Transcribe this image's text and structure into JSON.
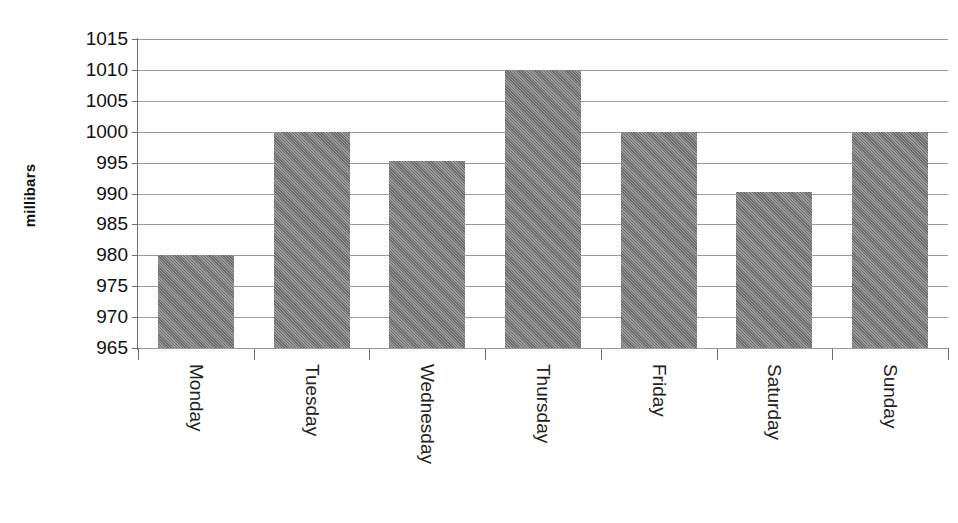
{
  "chart_data": {
    "type": "bar",
    "title": "",
    "xlabel": "",
    "ylabel": "millibars",
    "categories": [
      "Monday",
      "Tuesday",
      "Wednesday",
      "Thursday",
      "Friday",
      "Saturday",
      "Sunday"
    ],
    "values": [
      980,
      1000,
      995.2,
      1010,
      1000,
      990.2,
      1000
    ],
    "ylim": [
      965,
      1015
    ],
    "ytick_values": [
      1015,
      1010,
      1005,
      1000,
      995,
      990,
      985,
      980,
      975,
      970,
      965
    ],
    "ytick_labels": [
      "1015",
      "1010",
      "1005",
      "1000",
      "995",
      "990",
      "985",
      "980",
      "975",
      "970",
      "965"
    ],
    "ytick_step": 5,
    "grid": true,
    "grid_axis": "y",
    "legend": false,
    "legend_position": "none",
    "series": [
      {
        "name": "Atmospheric pressure",
        "color": "#808080",
        "values": [
          980,
          1000,
          995.2,
          1010,
          1000,
          990.2,
          1000
        ]
      }
    ],
    "bars": [
      {
        "category": "Monday",
        "value": 980,
        "label": "Monday"
      },
      {
        "category": "Tuesday",
        "value": 1000,
        "label": "Tuesday"
      },
      {
        "category": "Wednesday",
        "value": 995.2,
        "label": "Wednesday"
      },
      {
        "category": "Thursday",
        "value": 1010,
        "label": "Thursday"
      },
      {
        "category": "Friday",
        "value": 1000,
        "label": "Friday"
      },
      {
        "category": "Saturday",
        "value": 990.2,
        "label": "Saturday"
      },
      {
        "category": "Sunday",
        "value": 1000,
        "label": "Sunday"
      }
    ]
  },
  "axis": {
    "y_title": "millibars"
  },
  "colors": {
    "bar_fill": "#808080",
    "gridline": "#9a9a9a",
    "axis_line": "#6e6e6e",
    "text": "#111111",
    "background": "#ffffff"
  }
}
